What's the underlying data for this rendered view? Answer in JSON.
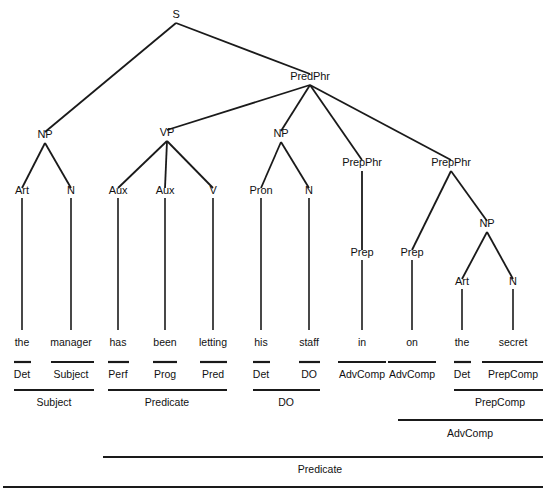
{
  "diagram": {
    "sentence": "the manager has been letting his staff in on the secret",
    "line_color": "#1a1a1a",
    "text_color": "#111111",
    "background": "#ffffff"
  },
  "tree_nodes": [
    {
      "id": "s",
      "label": "S",
      "x": 176,
      "y": 14,
      "level": 0
    },
    {
      "id": "predphr",
      "label": "PredPhr",
      "x": 310,
      "y": 76,
      "level": 1
    },
    {
      "id": "np1",
      "label": "NP",
      "x": 45,
      "y": 134,
      "level": 2
    },
    {
      "id": "vp",
      "label": "VP",
      "x": 167,
      "y": 132,
      "level": 2
    },
    {
      "id": "np2",
      "label": "NP",
      "x": 281,
      "y": 133,
      "level": 2
    },
    {
      "id": "prepphr1",
      "label": "PrepPhr",
      "x": 362,
      "y": 162,
      "level": 2
    },
    {
      "id": "prepphr2",
      "label": "PrepPhr",
      "x": 451,
      "y": 162,
      "level": 2
    },
    {
      "id": "art1",
      "label": "Art",
      "x": 22,
      "y": 190,
      "level": 3
    },
    {
      "id": "n1",
      "label": "N",
      "x": 71,
      "y": 190,
      "level": 3
    },
    {
      "id": "aux1",
      "label": "Aux",
      "x": 118,
      "y": 190,
      "level": 3
    },
    {
      "id": "aux2",
      "label": "Aux",
      "x": 165,
      "y": 190,
      "level": 3
    },
    {
      "id": "v",
      "label": "V",
      "x": 213,
      "y": 190,
      "level": 3
    },
    {
      "id": "pron",
      "label": "Pron",
      "x": 261,
      "y": 190,
      "level": 3
    },
    {
      "id": "n2",
      "label": "N",
      "x": 309,
      "y": 190,
      "level": 3
    },
    {
      "id": "np3",
      "label": "NP",
      "x": 487,
      "y": 223,
      "level": 3
    },
    {
      "id": "prep1",
      "label": "Prep",
      "x": 362,
      "y": 252,
      "level": 4
    },
    {
      "id": "prep2",
      "label": "Prep",
      "x": 412,
      "y": 252,
      "level": 4
    },
    {
      "id": "art2",
      "label": "Art",
      "x": 462,
      "y": 281,
      "level": 4
    },
    {
      "id": "n3",
      "label": "N",
      "x": 513,
      "y": 281,
      "level": 4
    }
  ],
  "tree_edges": [
    {
      "from": "s",
      "to": "np1"
    },
    {
      "from": "s",
      "to": "predphr"
    },
    {
      "from": "predphr",
      "to": "vp"
    },
    {
      "from": "predphr",
      "to": "np2"
    },
    {
      "from": "predphr",
      "to": "prepphr1"
    },
    {
      "from": "predphr",
      "to": "prepphr2"
    },
    {
      "from": "np1",
      "to": "art1"
    },
    {
      "from": "np1",
      "to": "n1"
    },
    {
      "from": "vp",
      "to": "aux1"
    },
    {
      "from": "vp",
      "to": "aux2"
    },
    {
      "from": "vp",
      "to": "v"
    },
    {
      "from": "np2",
      "to": "pron"
    },
    {
      "from": "np2",
      "to": "n2"
    },
    {
      "from": "prepphr1",
      "to": "prep1"
    },
    {
      "from": "prepphr2",
      "to": "prep2"
    },
    {
      "from": "prepphr2",
      "to": "np3"
    },
    {
      "from": "np3",
      "to": "art2"
    },
    {
      "from": "np3",
      "to": "n3"
    }
  ],
  "leaf_stems": [
    {
      "from": "art1",
      "x": 22,
      "y1": 198,
      "y2": 330
    },
    {
      "from": "n1",
      "x": 71,
      "y1": 198,
      "y2": 330
    },
    {
      "from": "aux1",
      "x": 118,
      "y1": 198,
      "y2": 330
    },
    {
      "from": "aux2",
      "x": 165,
      "y1": 198,
      "y2": 330
    },
    {
      "from": "v",
      "x": 213,
      "y1": 198,
      "y2": 330
    },
    {
      "from": "pron",
      "x": 261,
      "y1": 198,
      "y2": 330
    },
    {
      "from": "n2",
      "x": 309,
      "y1": 198,
      "y2": 330
    },
    {
      "from": "prep1",
      "x": 362,
      "y1": 260,
      "y2": 330
    },
    {
      "from": "prep2",
      "x": 412,
      "y1": 260,
      "y2": 330
    },
    {
      "from": "art2",
      "x": 462,
      "y1": 289,
      "y2": 330
    },
    {
      "from": "n3",
      "x": 513,
      "y1": 289,
      "y2": 330
    }
  ],
  "words": [
    {
      "text": "the",
      "x": 22,
      "y": 336,
      "node": "art1"
    },
    {
      "text": "manager",
      "x": 71,
      "y": 336,
      "node": "n1"
    },
    {
      "text": "has",
      "x": 118,
      "y": 336,
      "node": "aux1"
    },
    {
      "text": "been",
      "x": 165,
      "y": 336,
      "node": "aux2"
    },
    {
      "text": "letting",
      "x": 213,
      "y": 336,
      "node": "v"
    },
    {
      "text": "his",
      "x": 261,
      "y": 336,
      "node": "pron"
    },
    {
      "text": "staff",
      "x": 309,
      "y": 336,
      "node": "n2"
    },
    {
      "text": "in",
      "x": 362,
      "y": 336,
      "node": "prep1"
    },
    {
      "text": "on",
      "x": 412,
      "y": 336,
      "node": "prep2"
    },
    {
      "text": "the",
      "x": 462,
      "y": 336,
      "node": "art2"
    },
    {
      "text": "secret",
      "x": 513,
      "y": 336,
      "node": "n3"
    }
  ],
  "function_labels": [
    {
      "text": "Det",
      "x": 22,
      "y": 368,
      "bar_x1": 14,
      "bar_x2": 31,
      "bar_y": 362
    },
    {
      "text": "Subject",
      "x": 71,
      "y": 368,
      "bar_x1": 51,
      "bar_x2": 94,
      "bar_y": 362
    },
    {
      "text": "Perf",
      "x": 118,
      "y": 368,
      "bar_x1": 108,
      "bar_x2": 129,
      "bar_y": 362
    },
    {
      "text": "Prog",
      "x": 165,
      "y": 368,
      "bar_x1": 153,
      "bar_x2": 177,
      "bar_y": 362
    },
    {
      "text": "Pred",
      "x": 213,
      "y": 368,
      "bar_x1": 200,
      "bar_x2": 227,
      "bar_y": 362
    },
    {
      "text": "Det",
      "x": 261,
      "y": 368,
      "bar_x1": 253,
      "bar_x2": 270,
      "bar_y": 362
    },
    {
      "text": "DO",
      "x": 309,
      "y": 368,
      "bar_x1": 299,
      "bar_x2": 320,
      "bar_y": 362
    },
    {
      "text": "AdvComp",
      "x": 362,
      "y": 368,
      "bar_x1": 338,
      "bar_x2": 386,
      "bar_y": 362
    },
    {
      "text": "AdvComp",
      "x": 412,
      "y": 368,
      "bar_x1": 388,
      "bar_x2": 436,
      "bar_y": 362
    },
    {
      "text": "Det",
      "x": 462,
      "y": 368,
      "bar_x1": 454,
      "bar_x2": 471,
      "bar_y": 362
    },
    {
      "text": "PrepComp",
      "x": 513,
      "y": 368,
      "bar_x1": 482,
      "bar_x2": 543,
      "bar_y": 362
    }
  ],
  "brackets": [
    {
      "text": "Subject",
      "x1": 14,
      "x2": 94,
      "y": 390,
      "label_x": 54,
      "label_y": 396
    },
    {
      "text": "Predicate",
      "x1": 108,
      "x2": 227,
      "y": 390,
      "label_x": 167,
      "label_y": 396
    },
    {
      "text": "DO",
      "x1": 253,
      "x2": 320,
      "y": 390,
      "label_x": 286,
      "label_y": 396
    },
    {
      "text": "PrepComp",
      "x1": 454,
      "x2": 543,
      "y": 390,
      "label_x": 500,
      "label_y": 396
    },
    {
      "text": "AdvComp",
      "x1": 398,
      "x2": 543,
      "y": 420,
      "label_x": 470,
      "label_y": 427
    },
    {
      "text": "Predicate",
      "x1": 103,
      "x2": 543,
      "y": 457,
      "label_x": 320,
      "label_y": 463
    },
    {
      "text": "",
      "x1": 3,
      "x2": 543,
      "y": 487,
      "label_x": 272,
      "label_y": 492
    }
  ]
}
